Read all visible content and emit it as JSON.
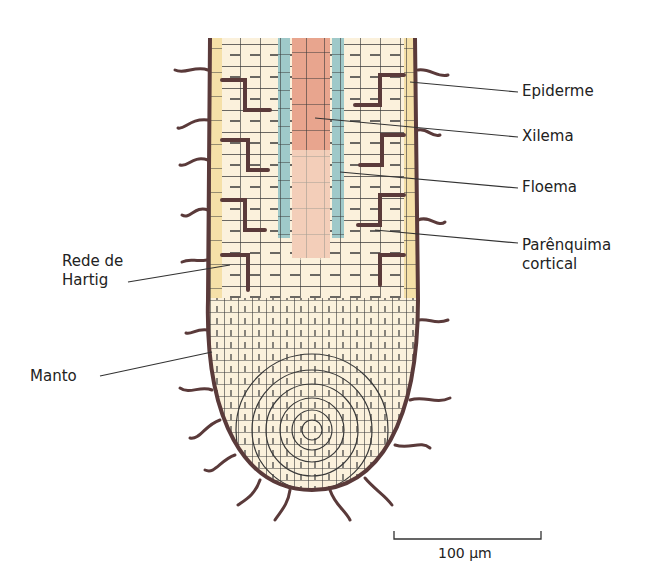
{
  "figure": {
    "colors": {
      "background": "#ffffff",
      "cell_fill": "#fbf1dc",
      "cell_wall": "#3a3a3a",
      "epidermis_fill": "#f5e0a8",
      "xylem_fill": "#e8a58e",
      "phloem_fill": "#9fc9c9",
      "hyphae": "#5a3a3a",
      "leader_line": "#333333"
    }
  },
  "labels": {
    "right": [
      {
        "text": "Epiderme"
      },
      {
        "text": "Xilema"
      },
      {
        "text": "Floema"
      },
      {
        "line1": "Parênquima",
        "line2": "cortical"
      }
    ],
    "left": [
      {
        "line1": "Rede de",
        "line2": "Hartig"
      },
      {
        "text": "Manto"
      }
    ]
  },
  "scale_bar": {
    "label": "100 µm"
  }
}
